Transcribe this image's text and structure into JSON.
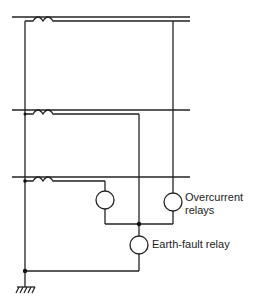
{
  "diagram": {
    "title": "",
    "labels": {
      "overcurrent_line1": "Overcurrent",
      "overcurrent_line2": "relays",
      "earth_fault": "Earth-fault relay"
    },
    "components": {
      "phases": 3,
      "current_transformers": 3,
      "overcurrent_relays": 2,
      "earth_fault_relays": 1,
      "earth_symbol": "ground-hatched"
    },
    "colors": {
      "line": "#222222",
      "background": "#ffffff"
    }
  }
}
